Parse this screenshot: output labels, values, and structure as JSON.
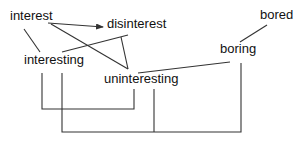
{
  "diagram": {
    "type": "word-relation-diagram",
    "line_color": "#333333",
    "text_color": "#111111",
    "nodes": [
      {
        "id": "interest",
        "label": "interest",
        "x": 10,
        "y": 9
      },
      {
        "id": "disinterest",
        "label": "disinterest",
        "x": 107,
        "y": 17
      },
      {
        "id": "interesting",
        "label": "interesting",
        "x": 24,
        "y": 53
      },
      {
        "id": "uninteresting",
        "label": "uninteresting",
        "x": 104,
        "y": 72
      },
      {
        "id": "boring",
        "label": "boring",
        "x": 220,
        "y": 42
      },
      {
        "id": "bored",
        "label": "bored",
        "x": 260,
        "y": 8
      }
    ],
    "edges": [
      {
        "from": "interest",
        "to": "interesting",
        "arrow": false
      },
      {
        "from": "interest",
        "to": "disinterest",
        "arrow": true
      },
      {
        "from": "interest",
        "to": "uninteresting",
        "arrow": false
      },
      {
        "from": "interesting",
        "to": "disinterest",
        "arrow": false
      },
      {
        "from": "disinterest",
        "to": "uninteresting",
        "arrow": false
      },
      {
        "from": "uninteresting",
        "to": "boring",
        "arrow": false
      },
      {
        "from": "boring",
        "to": "bored",
        "arrow": false
      }
    ],
    "brackets": [
      {
        "connects": [
          "interesting",
          "uninteresting"
        ]
      },
      {
        "connects": [
          "interesting",
          "uninteresting",
          "boring"
        ]
      }
    ]
  }
}
